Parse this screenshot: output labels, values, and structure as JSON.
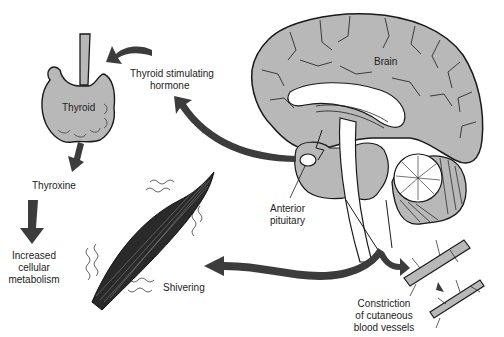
{
  "diagram": {
    "type": "physiology-flow",
    "colors": {
      "tissue_fill": "#b8b8b8",
      "outline": "#1a1a1a",
      "arrow": "#3c3c3c",
      "background": "#ffffff",
      "text": "#222222"
    },
    "labels": {
      "brain": "Brain",
      "thyroid": "Thyroid",
      "tsh_line1": "Thyroid stimulating",
      "tsh_line2": "hormone",
      "anterior_line1": "Anterior",
      "anterior_line2": "pituitary",
      "thyroxine": "Thyroxine",
      "metab_line1": "Increased",
      "metab_line2": "cellular",
      "metab_line3": "metabolism",
      "shivering": "Shivering",
      "constrict_line1": "Constriction",
      "constrict_line2": "of cutaneous",
      "constrict_line3": "blood vessels"
    },
    "nodes": [
      {
        "id": "brain",
        "label": "Brain"
      },
      {
        "id": "anterior-pituitary",
        "label": "Anterior pituitary"
      },
      {
        "id": "thyroid",
        "label": "Thyroid"
      },
      {
        "id": "thyroxine",
        "label": "Thyroxine"
      },
      {
        "id": "metabolism",
        "label": "Increased cellular metabolism"
      },
      {
        "id": "muscle",
        "label": "Shivering"
      },
      {
        "id": "blood-vessels",
        "label": "Constriction of cutaneous blood vessels"
      }
    ],
    "edges": [
      {
        "from": "anterior-pituitary",
        "to": "thyroid",
        "label": "Thyroid stimulating hormone"
      },
      {
        "from": "thyroid",
        "to": "thyroxine"
      },
      {
        "from": "thyroxine",
        "to": "metabolism"
      },
      {
        "from": "brain",
        "to": "muscle",
        "label": "Shivering"
      },
      {
        "from": "brain",
        "to": "blood-vessels",
        "label": "Constriction of cutaneous blood vessels"
      }
    ]
  }
}
